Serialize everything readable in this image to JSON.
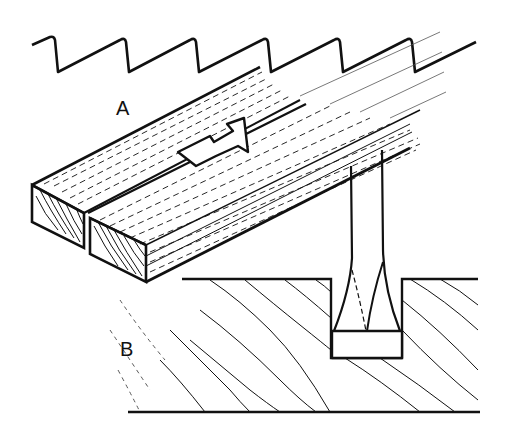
{
  "figure": {
    "labels": {
      "a": "A",
      "b": "B"
    },
    "colors": {
      "ink": "#111111",
      "paper": "#ffffff"
    },
    "parts": {
      "saw_teeth": "Saw tooth profile (sawtooth line)",
      "board_a": "Two boards with grain showing kerf and direction arrow",
      "direction_arrow": "Arrow indicating cutting direction along grain",
      "board_b": "Cross-section of wood with diagonal grain and chisel in groove",
      "chisel": "Chisel tip in rectangular groove"
    }
  }
}
